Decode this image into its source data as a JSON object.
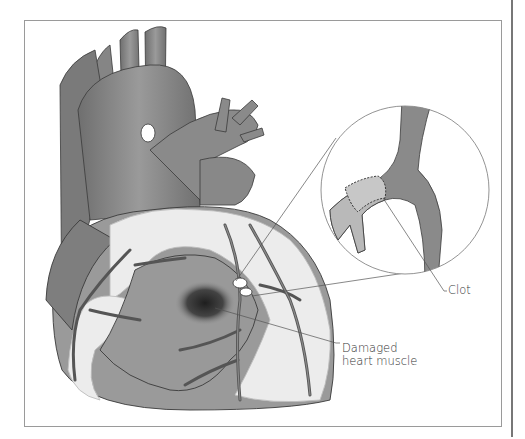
{
  "figure": {
    "labels": {
      "clot": "Clot",
      "damaged_line1": "Damaged",
      "damaged_line2": "heart muscle"
    },
    "colors": {
      "tissue": "#8f8f8f",
      "tissue_dark": "#5e5e5e",
      "vessel": "#7d7d7d",
      "fat": "#ececec",
      "damage": "#2a2a2a",
      "frame": "#9a9a9a",
      "leader": "#555555"
    }
  }
}
